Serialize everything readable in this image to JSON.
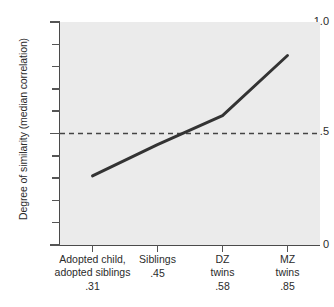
{
  "chart_data": {
    "type": "line",
    "title": "",
    "subtitle": "",
    "xlabel": "",
    "ylabel": "Degree of similarity (median correlation)",
    "categories": [
      "Adopted child,\nadopted siblings",
      "Siblings",
      "DZ\ntwins",
      "MZ\ntwins"
    ],
    "point_labels": [
      ".31",
      ".45",
      ".58",
      ".85"
    ],
    "values": [
      0.31,
      0.45,
      0.58,
      0.85
    ],
    "series": [
      {
        "name": "Median correlation",
        "values": [
          0.31,
          0.45,
          0.58,
          0.85
        ]
      }
    ],
    "ylim": [
      0,
      1.0
    ],
    "ytick_labels": [
      "1.0",
      "0.5",
      "0"
    ],
    "ytick_values": [
      1.0,
      0.5,
      0
    ],
    "yminor_interval": 0.1,
    "grid": false,
    "legend": "none",
    "annotations": [
      {
        "name": "reference-line",
        "style": "dashed",
        "y": 0.5,
        "label": ""
      }
    ],
    "colors": {
      "plot_background": "#ebebeb",
      "page_background": "#ffffff",
      "line": "#333333",
      "dashed_reference": "#444444",
      "axis": "#4a4a4a",
      "text": "#2b2b2b"
    }
  },
  "axis": {
    "y_title": "Degree of similarity (median correlation)",
    "y_ticks": [
      {
        "id": "ytick-1-0",
        "label": "1.0"
      },
      {
        "id": "ytick-0-5",
        "label": "0.5"
      },
      {
        "id": "ytick-0",
        "label": "0"
      }
    ]
  }
}
